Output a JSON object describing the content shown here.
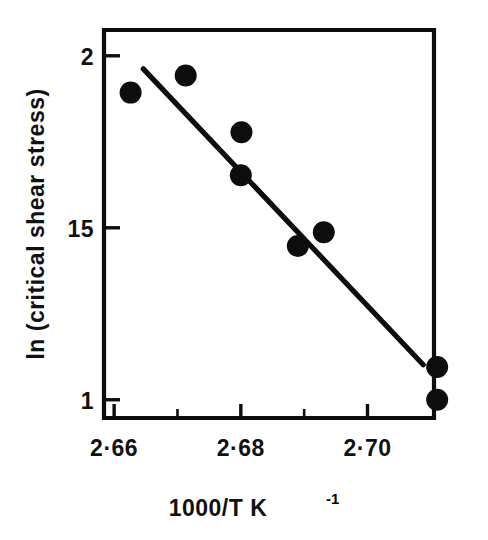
{
  "chart_data": {
    "type": "scatter",
    "title": "",
    "subtitle": "",
    "xlabel": "1000/T K",
    "xlabel_sup": "-1",
    "xlabel_full": "1000/T K⁻¹",
    "ylabel": "ln (critical shear stress)",
    "xlim": [
      2.6584,
      2.7105
    ],
    "ylim": [
      0.947,
      2.075
    ],
    "grid": false,
    "legend": null,
    "x_ticks_major": [
      {
        "value": 2.66,
        "label": "2·66"
      },
      {
        "value": 2.68,
        "label": "2·68"
      },
      {
        "value": 2.7,
        "label": "2·70"
      }
    ],
    "x_ticks_minor": [
      {
        "value": 2.67,
        "label": ""
      },
      {
        "value": 2.69,
        "label": ""
      }
    ],
    "y_ticks_major": [
      {
        "value": 2.0,
        "label": "2"
      },
      {
        "value": 1.5,
        "label": "15"
      },
      {
        "value": 1.0,
        "label": "1"
      }
    ],
    "y_ticks_minor": [],
    "points": [
      {
        "x": 2.6626,
        "y": 1.893
      },
      {
        "x": 2.6713,
        "y": 1.943
      },
      {
        "x": 2.6801,
        "y": 1.778
      },
      {
        "x": 2.68,
        "y": 1.653
      },
      {
        "x": 2.689,
        "y": 1.447
      },
      {
        "x": 2.6931,
        "y": 1.487
      },
      {
        "x": 2.711,
        "y": 1.095
      },
      {
        "x": 2.711,
        "y": 1.0
      }
    ],
    "marker": {
      "shape": "filled-circle",
      "radius_px": 11,
      "color": "#0d0d0d"
    },
    "fit_line": {
      "name": "linear fit",
      "x_start": 2.6646,
      "y_start": 1.962,
      "x_end": 2.7088,
      "y_end": 1.102,
      "color": "#0d0d0d"
    },
    "colors": {
      "ink": "#0d0d0d",
      "background": "#ffffff"
    }
  }
}
